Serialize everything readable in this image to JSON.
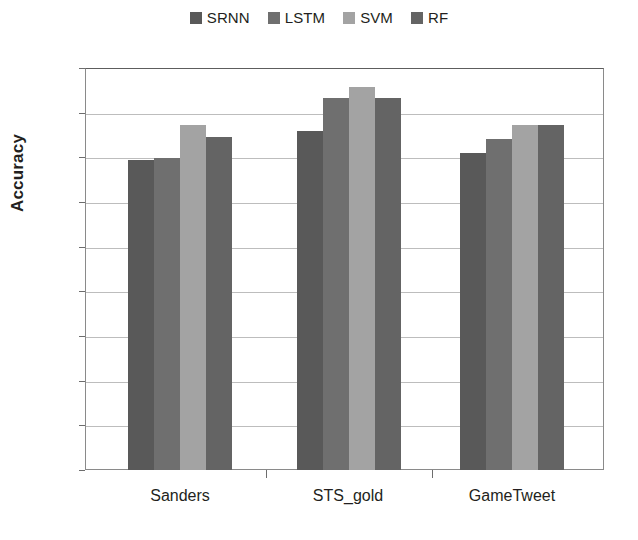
{
  "chart_data": {
    "type": "bar",
    "title": "",
    "xlabel": "",
    "ylabel": "Accuracy",
    "categories": [
      "Sanders",
      "STS_gold",
      "GameTweet"
    ],
    "series": [
      {
        "name": "SRNN",
        "color": "#595959",
        "values": [
          0.695,
          0.76,
          0.71
        ]
      },
      {
        "name": "LSTM",
        "color": "#6f6f6f",
        "values": [
          0.698,
          0.833,
          0.74
        ]
      },
      {
        "name": "SVM",
        "color": "#a3a3a3",
        "values": [
          0.772,
          0.857,
          0.772
        ]
      },
      {
        "name": "RF",
        "color": "#646464",
        "values": [
          0.745,
          0.833,
          0.772
        ]
      }
    ],
    "ylim": [
      0,
      0.9
    ],
    "y_ticks": [
      "0.9",
      "0.8",
      "0.7",
      "0.6",
      "0.5",
      "0.4",
      "0.3",
      "0.2",
      "0.1",
      "0"
    ],
    "y_tick_values": [
      0.9,
      0.8,
      0.7,
      0.6,
      0.5,
      0.4,
      0.3,
      0.2,
      0.1,
      0
    ],
    "grid": true,
    "legend_position": "top-center"
  },
  "legend": {
    "items": [
      {
        "label": "SRNN"
      },
      {
        "label": "LSTM"
      },
      {
        "label": "SVM"
      },
      {
        "label": "RF"
      }
    ]
  },
  "axes": {
    "y_title": "Accuracy",
    "y_labels": [
      "0.9",
      "0.8",
      "0.7",
      "0.6",
      "0.5",
      "0.4",
      "0.3",
      "0.2",
      "0.1",
      "0"
    ],
    "x_labels": [
      "Sanders",
      "STS_gold",
      "GameTweet"
    ]
  }
}
